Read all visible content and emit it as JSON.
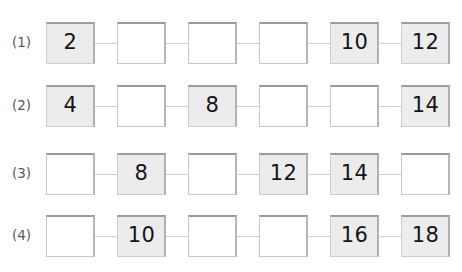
{
  "worksheet": {
    "title": "Number pattern fill-in-the-blank chains",
    "rows": [
      {
        "label": "(1)",
        "cells": [
          {
            "value": "2",
            "filled": true
          },
          {
            "value": "",
            "filled": false
          },
          {
            "value": "",
            "filled": false
          },
          {
            "value": "",
            "filled": false
          },
          {
            "value": "10",
            "filled": true
          },
          {
            "value": "12",
            "filled": true
          }
        ]
      },
      {
        "label": "(2)",
        "cells": [
          {
            "value": "4",
            "filled": true
          },
          {
            "value": "",
            "filled": false
          },
          {
            "value": "8",
            "filled": true
          },
          {
            "value": "",
            "filled": false
          },
          {
            "value": "",
            "filled": false
          },
          {
            "value": "14",
            "filled": true
          }
        ]
      },
      {
        "label": "(3)",
        "cells": [
          {
            "value": "",
            "filled": false
          },
          {
            "value": "8",
            "filled": true
          },
          {
            "value": "",
            "filled": false
          },
          {
            "value": "12",
            "filled": true
          },
          {
            "value": "14",
            "filled": true
          },
          {
            "value": "",
            "filled": false
          }
        ]
      },
      {
        "label": "(4)",
        "cells": [
          {
            "value": "",
            "filled": false
          },
          {
            "value": "10",
            "filled": true
          },
          {
            "value": "",
            "filled": false
          },
          {
            "value": "",
            "filled": false
          },
          {
            "value": "16",
            "filled": true
          },
          {
            "value": "18",
            "filled": true
          }
        ]
      }
    ],
    "colors": {
      "page_background": "#ffffff",
      "filled_box_fill": "#ececec",
      "empty_box_fill": "#ffffff",
      "box_border": "#c8c8c8",
      "box_top_shadow": "#9a9a9a",
      "connector_line": "#cfcfcf",
      "label_text": "#5a5a5a",
      "value_text": "#151515"
    },
    "layout": {
      "row_tops": [
        19,
        82,
        150,
        212
      ],
      "chain_left": 46,
      "cell_width": 49,
      "cell_height": 42,
      "connector_width": 22
    }
  }
}
